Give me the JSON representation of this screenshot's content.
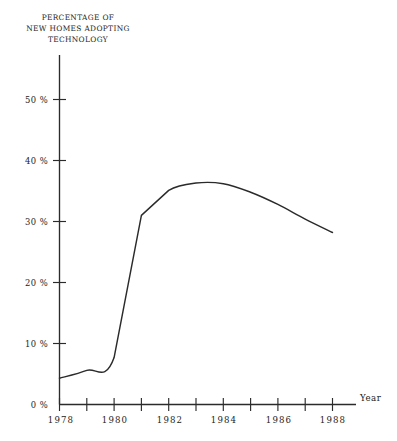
{
  "chart_data": {
    "type": "line",
    "title": "PERCENTAGE OF NEW HOMES ADOPTING TECHNOLOGY",
    "title_lines": [
      "PERCENTAGE OF",
      "NEW HOMES ADOPTING",
      "TECHNOLOGY"
    ],
    "xlabel": "Year",
    "ylabel": "",
    "x": [
      1978,
      1979,
      1980,
      1981,
      1982,
      1983,
      1984,
      1985,
      1986,
      1987,
      1988
    ],
    "values": [
      4.3,
      5.6,
      7.7,
      31.0,
      35.1,
      36.3,
      36.2,
      34.8,
      32.8,
      30.4,
      28.2
    ],
    "xlim": [
      1978,
      1988
    ],
    "ylim": [
      0,
      55
    ],
    "grid": false,
    "legend": null,
    "x_ticks_major": [
      1978,
      1980,
      1982,
      1984,
      1986,
      1988
    ],
    "x_ticks_minor": [
      1979,
      1981,
      1983,
      1985,
      1987
    ],
    "x_tick_labels": [
      "1978",
      "1980",
      "1982",
      "1984",
      "1986",
      "1988"
    ],
    "y_ticks": [
      0,
      10,
      20,
      30,
      40,
      50
    ],
    "y_tick_labels": [
      "0 %",
      "10 %",
      "20 %",
      "30 %",
      "40 %",
      "50 %"
    ]
  },
  "axis": {
    "x_name": "Year",
    "y_tick_0": "0 %",
    "y_tick_10": "10 %",
    "y_tick_20": "20 %",
    "y_tick_30": "30 %",
    "y_tick_40": "40 %",
    "y_tick_50": "50 %",
    "x_tick_1978": "1978",
    "x_tick_1980": "1980",
    "x_tick_1982": "1982",
    "x_tick_1984": "1984",
    "x_tick_1986": "1986",
    "x_tick_1988": "1988"
  },
  "title": {
    "line1": "PERCENTAGE OF",
    "line2": "NEW HOMES ADOPTING",
    "line3": "TECHNOLOGY"
  },
  "colors": {
    "ink": "#2b2b2b",
    "background": "#ffffff"
  }
}
